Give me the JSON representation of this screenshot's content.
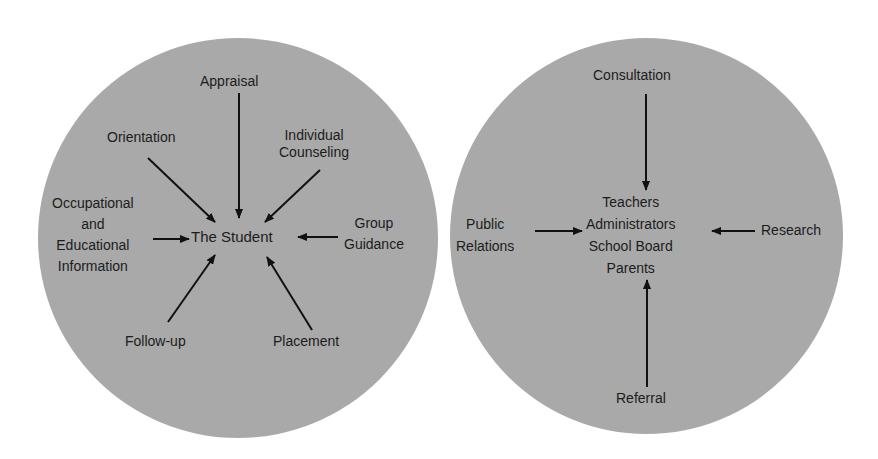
{
  "colors": {
    "circle_fill": "#a9a9a9",
    "background": "#ffffff",
    "arrow": "#111111",
    "text": "#1c1c1c"
  },
  "left_diagram": {
    "center": "The Student",
    "services": {
      "appraisal": "Appraisal",
      "orientation": "Orientation",
      "individual_counseling": [
        "Individual",
        "Counseling"
      ],
      "occupational_info": [
        "Occupational",
        "and",
        "Educational",
        "Information"
      ],
      "group_guidance": [
        "Group",
        "Guidance"
      ],
      "follow_up": "Follow-up",
      "placement": "Placement"
    }
  },
  "right_diagram": {
    "center": [
      "Teachers",
      "Administrators",
      "School Board",
      "Parents"
    ],
    "services": {
      "consultation": "Consultation",
      "public_relations": [
        "Public",
        "Relations"
      ],
      "research": "Research",
      "referral": "Referral"
    }
  }
}
